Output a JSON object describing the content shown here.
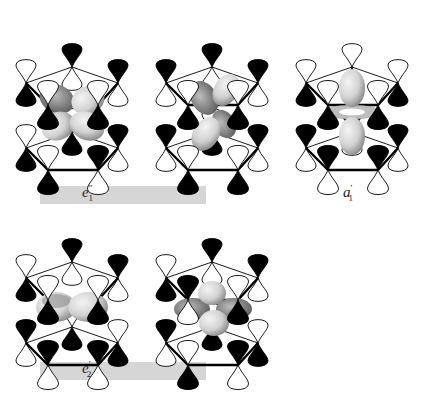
{
  "figure": {
    "colors": {
      "filled_lobe": "#000000",
      "open_lobe": "#ffffff",
      "ring_bond": "#000000",
      "label_bar": "#d6d6d6",
      "metal_orbital_light": "#e6e6e6",
      "metal_orbital_dark": "#6e6e6e"
    },
    "label_bars": [
      {
        "id": "bar-e1pp",
        "x": 40,
        "y": 186,
        "w": 166,
        "h": 18
      },
      {
        "id": "bar-e2p",
        "x": 40,
        "y": 362,
        "w": 166,
        "h": 18
      }
    ],
    "labels": [
      {
        "id": "label-e1pp",
        "base": "e",
        "sub": "1",
        "sup": "″",
        "x": 82,
        "y": 183
      },
      {
        "id": "label-a1p",
        "base": "a",
        "sub": "1",
        "sup": "′",
        "x": 343,
        "y": 183
      },
      {
        "id": "label-e2p",
        "base": "e",
        "sub": "2",
        "sup": "′",
        "x": 82,
        "y": 359
      }
    ],
    "panels": [
      {
        "id": "panel-e1pp-a",
        "symmetry": "e1''",
        "x": 10,
        "y": 20,
        "metal_orbital": "dxz-like"
      },
      {
        "id": "panel-e1pp-b",
        "symmetry": "e1''",
        "x": 150,
        "y": 20,
        "metal_orbital": "dyz-like"
      },
      {
        "id": "panel-a1p",
        "symmetry": "a1'",
        "x": 290,
        "y": 20,
        "metal_orbital": "dz2"
      },
      {
        "id": "panel-e2p-a",
        "symmetry": "e2'",
        "x": 10,
        "y": 215,
        "metal_orbital": "dx2-y2"
      },
      {
        "id": "panel-e2p-b",
        "symmetry": "e2'",
        "x": 150,
        "y": 215,
        "metal_orbital": "dxy"
      }
    ]
  }
}
